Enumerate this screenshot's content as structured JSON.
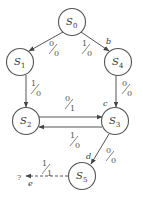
{
  "diagram": {
    "type": "state-transition-diagram",
    "states": [
      {
        "id": "S0",
        "label": "S",
        "sub": "0",
        "cx": 72,
        "cy": 22
      },
      {
        "id": "S1",
        "label": "S",
        "sub": "1",
        "cx": 20,
        "cy": 62
      },
      {
        "id": "S4",
        "label": "S",
        "sub": "4",
        "cx": 118,
        "cy": 62
      },
      {
        "id": "S2",
        "label": "S",
        "sub": "2",
        "cx": 26,
        "cy": 121
      },
      {
        "id": "S3",
        "label": "S",
        "sub": "3",
        "cx": 115,
        "cy": 121
      },
      {
        "id": "S5",
        "label": "S",
        "sub": "5",
        "cx": 82,
        "cy": 176
      }
    ],
    "transitions": [
      {
        "from": "S0",
        "to": "S1",
        "input": "0",
        "output": "0"
      },
      {
        "from": "S0",
        "to": "S4",
        "input": "1",
        "output": "0",
        "point": "b"
      },
      {
        "from": "S1",
        "to": "S2",
        "input": "1",
        "output": "0"
      },
      {
        "from": "S4",
        "to": "S3",
        "input": "0",
        "output": "0",
        "point": "c"
      },
      {
        "from": "S2",
        "to": "S3",
        "input": "0",
        "output": "1"
      },
      {
        "from": "S3",
        "to": "S2",
        "input": "1",
        "output": "0"
      },
      {
        "from": "S3",
        "to": "S5",
        "input": "0",
        "output": "0",
        "point": "d"
      },
      {
        "from": "S5",
        "to": "?",
        "input": "1",
        "output": "1",
        "point": "e",
        "dashed": true
      }
    ],
    "unknown_target": "?"
  }
}
